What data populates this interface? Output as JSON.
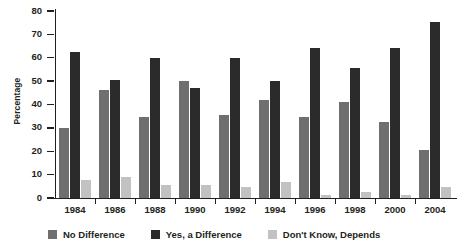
{
  "chart_data": {
    "type": "bar",
    "title": "",
    "xlabel": "",
    "ylabel": "Percentage",
    "ylim": [
      0,
      80
    ],
    "ytick_step": 10,
    "yticks": [
      80,
      70,
      60,
      50,
      40,
      30,
      20,
      10,
      0
    ],
    "grid": false,
    "legend_position": "bottom",
    "categories": [
      "1984",
      "1986",
      "1988",
      "1990",
      "1992",
      "1994",
      "1996",
      "1998",
      "2000",
      "2004"
    ],
    "series": [
      {
        "name": "No Difference",
        "color": "#6f6f6f",
        "values": [
          30,
          46,
          34.5,
          50,
          35.5,
          42,
          34.5,
          41,
          32.5,
          20.5
        ]
      },
      {
        "name": "Yes, a Difference",
        "color": "#2b2b2b",
        "values": [
          62.5,
          50.5,
          60,
          47,
          60,
          50,
          64,
          55.5,
          64,
          75.5
        ]
      },
      {
        "name": "Don't Know, Depends",
        "color": "#c2c2c2",
        "values": [
          7.5,
          9,
          5.5,
          5.5,
          4.5,
          7,
          1.5,
          2.5,
          1.5,
          4.5
        ]
      }
    ]
  },
  "legend": {
    "items": [
      {
        "label": "No Difference"
      },
      {
        "label": "Yes, a Difference"
      },
      {
        "label": "Don't Know, Depends"
      }
    ]
  }
}
